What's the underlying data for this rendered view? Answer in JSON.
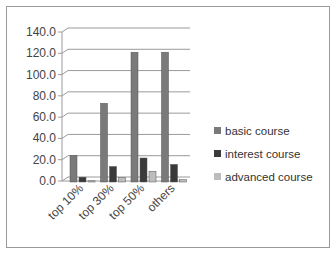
{
  "chart_data": {
    "type": "bar",
    "title": "",
    "xlabel": "",
    "ylabel": "",
    "categories": [
      "top 10%",
      "top 30%",
      "top 50%",
      "others"
    ],
    "series": [
      {
        "name": "basic course",
        "color": "#7a7a7a",
        "values": [
          24,
          73,
          121,
          121
        ]
      },
      {
        "name": "interest course",
        "color": "#3a3a3a",
        "values": [
          5,
          15,
          23,
          17
        ]
      },
      {
        "name": "advanced course",
        "color": "#bdbdbd",
        "values": [
          3,
          6,
          12,
          4
        ]
      }
    ],
    "ylim": [
      0,
      140
    ],
    "yticks": [
      "0.0",
      "20.0",
      "40.0",
      "60.0",
      "80.0",
      "100.0",
      "120.0",
      "140.0"
    ],
    "grid": true,
    "legend_position": "right",
    "style": "3d-clustered-column"
  }
}
